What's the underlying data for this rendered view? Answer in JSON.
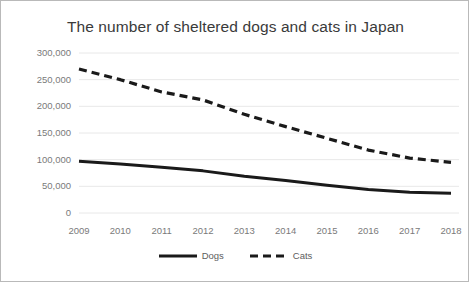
{
  "chart_data": {
    "type": "line",
    "title": "The number of sheltered dogs and cats in Japan",
    "xlabel": "",
    "ylabel": "",
    "categories": [
      "2009",
      "2010",
      "2011",
      "2012",
      "2013",
      "2014",
      "2015",
      "2016",
      "2017",
      "2018"
    ],
    "x": [
      2009,
      2010,
      2011,
      2012,
      2013,
      2014,
      2015,
      2016,
      2017,
      2018
    ],
    "series": [
      {
        "name": "Dogs",
        "style": "solid",
        "color": "#1a1a1a",
        "values": [
          97000,
          92000,
          86000,
          79000,
          69000,
          61000,
          52000,
          44000,
          39000,
          37000
        ]
      },
      {
        "name": "Cats",
        "style": "dashed",
        "color": "#1a1a1a",
        "values": [
          270000,
          250000,
          227000,
          212000,
          185000,
          162000,
          140000,
          118000,
          103000,
          95000
        ]
      }
    ],
    "ylim": [
      0,
      300000
    ],
    "ytick_values": [
      0,
      50000,
      100000,
      150000,
      200000,
      250000,
      300000
    ],
    "ytick_labels": [
      "0",
      "50,000",
      "100,000",
      "150,000",
      "200,000",
      "250,000",
      "300,000"
    ],
    "grid": true,
    "grid_axis": "y",
    "grid_color": "#e8e8e8",
    "legend_position": "bottom",
    "border_color": "#b9b9b9",
    "background_color": "#ffffff",
    "title_color": "#3a3a3a",
    "tick_label_color": "#7a7a7a"
  }
}
